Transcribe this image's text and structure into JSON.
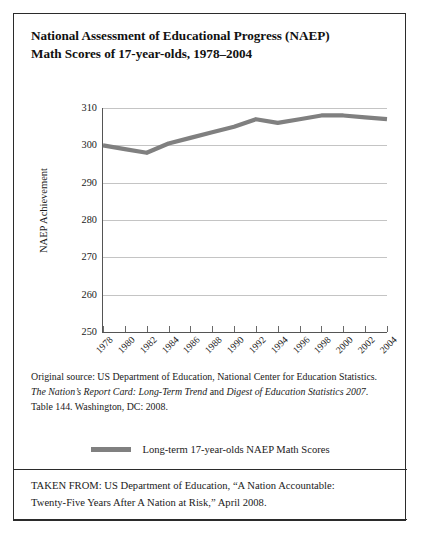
{
  "title": {
    "line1": "National Assessment of Educational Progress (NAEP)",
    "line2": "Math Scores of 17-year-olds, 1978–2004"
  },
  "source": {
    "line1": "Original source: US Department of Education, National Center for Education Statistics.",
    "line2_pre": "",
    "line2_italic1": "The Nation’s Report Card: Long-Term Trend",
    "line2_mid": " and ",
    "line2_italic2": "Digest of Education Statistics 2007",
    "line2_post": ".",
    "line3": "Table 144. Washington, DC: 2008."
  },
  "taken_from": {
    "line1": "TAKEN FROM: US Department of Education, “A Nation Accountable:",
    "line2": "Twenty-Five Years After A Nation at Risk,” April 2008."
  },
  "legend": {
    "label": "Long-term 17-year-olds NAEP Math Scores",
    "color": "#808080"
  },
  "chart_data": {
    "type": "line",
    "title": "National Assessment of Educational Progress (NAEP) Math Scores of 17-year-olds, 1978–2004",
    "xlabel": "",
    "ylabel": "NAEP Achievement",
    "x": [
      1978,
      1980,
      1982,
      1984,
      1986,
      1988,
      1990,
      1992,
      1994,
      1996,
      1998,
      2000,
      2002,
      2004
    ],
    "categories": [
      "1978",
      "1980",
      "1982",
      "1984",
      "1986",
      "1988",
      "1990",
      "1992",
      "1994",
      "1996",
      "1998",
      "2000",
      "2002",
      "2004"
    ],
    "series": [
      {
        "name": "Long-term 17-year-olds NAEP Math Scores",
        "color": "#808080",
        "values": [
          300,
          299,
          298,
          300.5,
          302,
          303.5,
          305,
          307,
          306,
          307,
          308,
          308,
          307.5,
          307
        ]
      }
    ],
    "ylim": [
      250,
      310
    ],
    "yticks": [
      250,
      260,
      270,
      280,
      290,
      300,
      310
    ],
    "ytick_labels": [
      "250",
      "260",
      "270",
      "280",
      "290",
      "300",
      "310"
    ],
    "grid": true,
    "grid_axis": "y",
    "legend_position": "below-plot"
  }
}
